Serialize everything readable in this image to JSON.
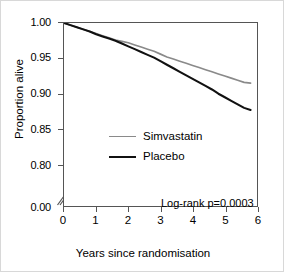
{
  "figure": {
    "title": "",
    "annotation": "Log-rank p=0.0003"
  },
  "axes": {
    "y": {
      "label": "Proportion alive",
      "ticks": [
        "1.00",
        "0.95",
        "0.90",
        "0.85",
        "0.80",
        "0.00"
      ],
      "has_break": true
    },
    "x": {
      "label": "Years since randomisation",
      "ticks": [
        "0",
        "1",
        "2",
        "3",
        "4",
        "5",
        "6"
      ]
    }
  },
  "legend": {
    "items": [
      {
        "label": "Simvastatin",
        "color": "#8a8a8a"
      },
      {
        "label": "Placebo",
        "color": "#111111"
      }
    ]
  },
  "chart_data": {
    "type": "line",
    "title": "",
    "xlabel": "Years since randomisation",
    "ylabel": "Proportion alive",
    "xlim": [
      0,
      6
    ],
    "ylim": [
      0.795,
      1.0
    ],
    "y_axis_break": {
      "between": [
        0.0,
        0.8
      ],
      "note": "axis broken below 0.80"
    },
    "y_ticks": [
      1.0,
      0.95,
      0.9,
      0.85,
      0.8,
      0.0
    ],
    "x_ticks": [
      0,
      1,
      2,
      3,
      4,
      5,
      6
    ],
    "grid": false,
    "legend_position": "center-left",
    "annotations": [
      {
        "text": "Log-rank p=0.0003",
        "x": 5.2,
        "y": 0.806
      }
    ],
    "series": [
      {
        "name": "Simvastatin",
        "color": "#8a8a8a",
        "x": [
          0,
          0.2,
          0.4,
          0.6,
          0.8,
          1.0,
          1.2,
          1.4,
          1.6,
          1.8,
          2.0,
          2.2,
          2.4,
          2.6,
          2.8,
          3.0,
          3.2,
          3.4,
          3.6,
          3.8,
          4.0,
          4.2,
          4.4,
          4.6,
          4.8,
          5.0,
          5.2,
          5.4,
          5.6,
          5.8
        ],
        "values": [
          1.0,
          0.997,
          0.994,
          0.991,
          0.988,
          0.985,
          0.982,
          0.979,
          0.976,
          0.974,
          0.972,
          0.969,
          0.966,
          0.963,
          0.96,
          0.956,
          0.952,
          0.949,
          0.946,
          0.943,
          0.94,
          0.937,
          0.934,
          0.931,
          0.928,
          0.925,
          0.922,
          0.919,
          0.916,
          0.915
        ]
      },
      {
        "name": "Placebo",
        "color": "#111111",
        "x": [
          0,
          0.2,
          0.4,
          0.6,
          0.8,
          1.0,
          1.2,
          1.4,
          1.6,
          1.8,
          2.0,
          2.2,
          2.4,
          2.6,
          2.8,
          3.0,
          3.2,
          3.4,
          3.6,
          3.8,
          4.0,
          4.2,
          4.4,
          4.6,
          4.8,
          5.0,
          5.2,
          5.4,
          5.6,
          5.8
        ],
        "values": [
          1.0,
          0.997,
          0.994,
          0.991,
          0.988,
          0.984,
          0.981,
          0.978,
          0.975,
          0.971,
          0.967,
          0.963,
          0.959,
          0.955,
          0.951,
          0.946,
          0.941,
          0.936,
          0.931,
          0.926,
          0.921,
          0.916,
          0.911,
          0.906,
          0.9,
          0.895,
          0.89,
          0.885,
          0.88,
          0.877
        ]
      }
    ]
  }
}
